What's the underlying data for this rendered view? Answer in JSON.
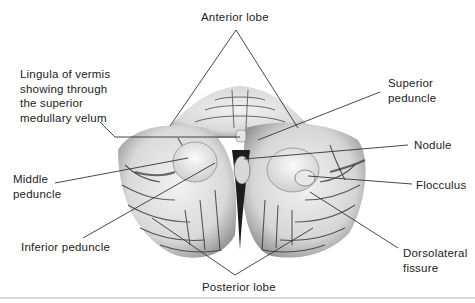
{
  "figure": {
    "labels": {
      "anterior_lobe": "Anterior lobe",
      "lingula": [
        "Lingula of vermis",
        "showing through",
        "the superior",
        "medullary velum"
      ],
      "superior_peduncle": [
        "Superior",
        "peduncle"
      ],
      "nodule": "Nodule",
      "middle_peduncle": [
        "Middle",
        "peduncle"
      ],
      "flocculus": "Flocculus",
      "inferior_peduncle": "Inferior peduncle",
      "dorsolateral_fissure": [
        "Dorsolateral",
        "fissure"
      ],
      "posterior_lobe": "Posterior lobe"
    },
    "colors": {
      "leader_line": "#333333",
      "text": "#222222",
      "specimen_light": "#eeeeee",
      "specimen_dark": "#1a1a1a"
    }
  }
}
